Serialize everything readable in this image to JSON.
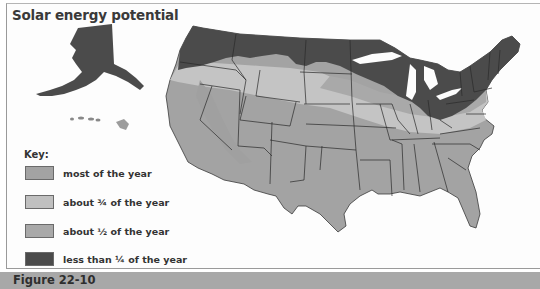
{
  "title": "Solar energy potential",
  "key": {
    "label": "Key:",
    "items": [
      {
        "label": "most of the year",
        "color": "#a0a0a0"
      },
      {
        "label": "about ¾ of the year",
        "color": "#bdbdbd"
      },
      {
        "label": "about ½ of the year",
        "color": "#9c9c9c"
      },
      {
        "label": "less than ¼ of the year",
        "color": "#4a4a4a"
      }
    ]
  },
  "caption": "Figure 22-10",
  "colors": {
    "most": "#a3a3a3",
    "three_quarters": "#c4c4c4",
    "half": "#a9a9a9",
    "quarter": "#4b4b4b",
    "border": "#2a2a2a",
    "caption_bar": "#a8a8a8"
  }
}
